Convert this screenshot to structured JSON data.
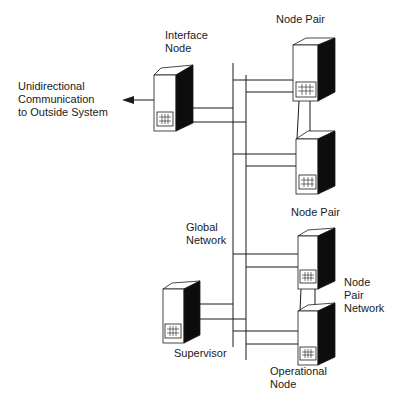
{
  "labels": {
    "interface_node": "Interface\nNode",
    "outside": "Unidirectional\nCommunication\nto Outside System",
    "node_pair_top": "Node Pair",
    "node_pair_bottom": "Node Pair",
    "global_network": "Global\nNetwork",
    "node_pair_network": "Node\nPair\nNetwork",
    "supervisor": "Supervisor",
    "operational_node": "Operational\nNode"
  },
  "colors": {
    "line": "#1a1a1a",
    "dark_side": "#0d0d0d",
    "face": "#ffffff"
  },
  "nodes": [
    {
      "id": "interface-node",
      "x": 154,
      "y": 67,
      "w": 22,
      "h": 64
    },
    {
      "id": "node-pair-1a",
      "x": 293,
      "y": 45,
      "w": 25,
      "h": 56
    },
    {
      "id": "node-pair-1b",
      "x": 296,
      "y": 138,
      "w": 22,
      "h": 56
    },
    {
      "id": "node-pair-2a",
      "x": 298,
      "y": 235,
      "w": 20,
      "h": 54
    },
    {
      "id": "node-pair-2b",
      "x": 298,
      "y": 310,
      "w": 20,
      "h": 55
    },
    {
      "id": "supervisor-node",
      "x": 163,
      "y": 288,
      "w": 21,
      "h": 55
    }
  ]
}
